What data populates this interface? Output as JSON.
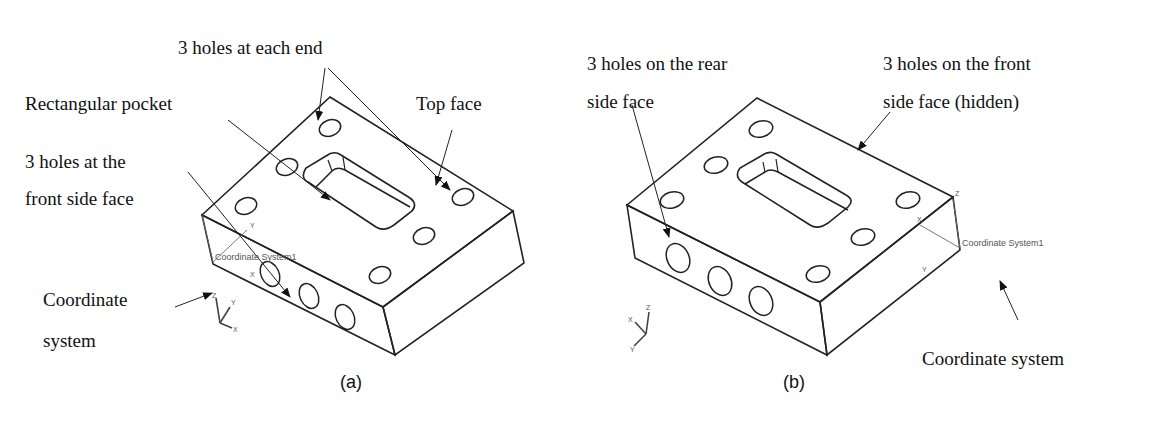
{
  "panel_a": {
    "caption": "(a)",
    "labels": {
      "holes_each_end": "3 holes at each end",
      "rect_pocket": "Rectangular pocket",
      "top_face": "Top face",
      "holes_front_line1": "3 holes at the",
      "holes_front_line2": "front side face",
      "coord_line1": "Coordinate",
      "coord_line2": "system"
    },
    "cs_name": "Coordinate System1",
    "axes": {
      "x": "X",
      "y": "Y",
      "z": "Z"
    }
  },
  "panel_b": {
    "caption": "(b)",
    "labels": {
      "holes_rear_line1": "3 holes on the rear",
      "holes_rear_line2": "side face",
      "holes_front_line1": "3 holes on the front",
      "holes_front_line2": "side face (hidden)",
      "coord": "Coordinate system"
    },
    "cs_name": "Coordinate System1",
    "axes": {
      "x": "X",
      "y": "Y",
      "z": "Z"
    }
  }
}
